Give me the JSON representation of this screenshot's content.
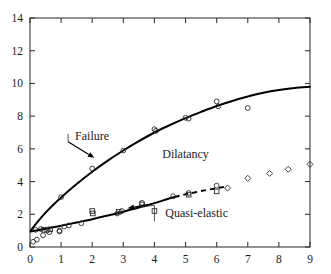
{
  "figure": {
    "background_color": "#ffffff",
    "foreground_color": "#000000"
  },
  "chart_data": {
    "type": "scatter",
    "title": "",
    "xlabel": "",
    "ylabel": "",
    "xlim": [
      0,
      9
    ],
    "ylim": [
      0,
      14
    ],
    "xticks": [
      0,
      1,
      2,
      3,
      4,
      5,
      6,
      7,
      8,
      9
    ],
    "yticks": [
      0,
      2,
      4,
      6,
      8,
      10,
      12,
      14
    ],
    "xtick_labels": [
      "0",
      "1",
      "2",
      "3",
      "4",
      "5",
      "6",
      "7",
      "8",
      "9"
    ],
    "ytick_labels": [
      "0",
      "2",
      "4",
      "6",
      "8",
      "10",
      "12",
      "14"
    ],
    "grid": false,
    "legend_position": "none",
    "frame": "box",
    "tick_direction": "in",
    "annotations": [
      {
        "name": "failure-label",
        "text": "Failure",
        "x": 1.45,
        "y": 6.55,
        "arrow_to_x": 2.07,
        "arrow_to_y": 5.45
      },
      {
        "name": "dilatancy-label",
        "text": "Dilatancy",
        "x": 4.25,
        "y": 5.45,
        "arrow_to_x": null,
        "arrow_to_y": null
      },
      {
        "name": "quasi-elastic-label",
        "text": "Quasi-elastic",
        "x": 4.35,
        "y": 1.82,
        "leader_to_x": 4.0,
        "leader_to_y": 2.55,
        "arrow_to_x": 3.2,
        "arrow_to_y": 2.55
      }
    ],
    "series": [
      {
        "name": "Failure fit curve",
        "type": "line",
        "style": "solid",
        "color": "#000000",
        "x": [
          0.02,
          0.25,
          0.5,
          0.8,
          1.1,
          1.5,
          2.0,
          2.5,
          3.0,
          3.5,
          4.0,
          4.5,
          5.0,
          5.5,
          6.0,
          6.5,
          7.0,
          7.5,
          8.0,
          8.5,
          9.0
        ],
        "y": [
          1.0,
          1.55,
          2.1,
          2.68,
          3.2,
          3.85,
          4.6,
          5.28,
          5.9,
          6.47,
          7.0,
          7.46,
          7.88,
          8.26,
          8.62,
          8.93,
          9.2,
          9.43,
          9.6,
          9.72,
          9.8
        ]
      },
      {
        "name": "Failure data points",
        "type": "scatter",
        "marker": "circle",
        "color": "#2a2a2a",
        "x": [
          0.18,
          0.35,
          0.55,
          0.95,
          1.0,
          2.0,
          3.0,
          4.0,
          4.05,
          5.0,
          5.1,
          6.0,
          6.05,
          7.0
        ],
        "y": [
          1.05,
          1.1,
          1.0,
          1.0,
          3.05,
          4.8,
          5.9,
          7.2,
          7.1,
          7.9,
          7.85,
          8.9,
          8.6,
          8.5
        ]
      },
      {
        "name": "Quasi-elastic fit solid segment",
        "type": "line",
        "style": "solid",
        "color": "#000000",
        "x": [
          0.02,
          0.5,
          1.0,
          1.5,
          2.0,
          2.5,
          3.0,
          3.5,
          4.0,
          4.4,
          4.65
        ],
        "y": [
          0.95,
          1.12,
          1.3,
          1.5,
          1.7,
          1.92,
          2.16,
          2.42,
          2.68,
          2.92,
          3.06
        ]
      },
      {
        "name": "Quasi-elastic fit dashed segment",
        "type": "line",
        "style": "dashed",
        "color": "#000000",
        "x": [
          4.65,
          5.0,
          5.5,
          6.0,
          6.25
        ],
        "y": [
          3.06,
          3.22,
          3.42,
          3.6,
          3.68
        ]
      },
      {
        "name": "Quasi-elastic circle points",
        "type": "scatter",
        "marker": "circle",
        "color": "#2a2a2a",
        "x": [
          0.1,
          0.22,
          0.42,
          0.62,
          0.95,
          1.1,
          1.25,
          1.65,
          2.8,
          2.95,
          3.6,
          4.6,
          5.1,
          6.0
        ],
        "y": [
          0.32,
          0.45,
          0.72,
          0.9,
          0.95,
          1.25,
          1.32,
          1.45,
          2.05,
          2.2,
          2.7,
          3.1,
          3.3,
          3.75
        ]
      },
      {
        "name": "Quasi-elastic square points",
        "type": "scatter",
        "marker": "square",
        "color": "#2a2a2a",
        "x": [
          0.45,
          0.65,
          2.0,
          2.02,
          2.85,
          3.6,
          4.0,
          5.1,
          6.0
        ],
        "y": [
          1.05,
          1.08,
          2.2,
          2.05,
          2.15,
          2.6,
          2.2,
          3.2,
          3.4
        ]
      },
      {
        "name": "Upper scatter diamond points",
        "type": "scatter",
        "marker": "diamond",
        "color": "#4a4a4a",
        "x": [
          6.35,
          7.0,
          7.7,
          8.3,
          9.0
        ],
        "y": [
          3.6,
          4.2,
          4.5,
          4.75,
          5.05
        ]
      }
    ]
  }
}
